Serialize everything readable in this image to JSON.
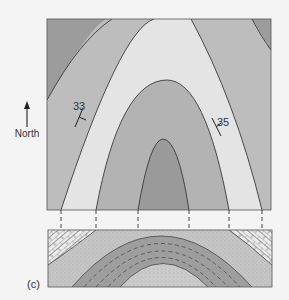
{
  "figure": {
    "panel_label": "(c)",
    "north_label": "North",
    "strike_dip": [
      {
        "value": "33",
        "side": "west"
      },
      {
        "value": "35",
        "side": "east"
      }
    ]
  },
  "map": {
    "description": "Geologic map view of a plunging anticline",
    "colors": {
      "outer_dark": "#9c9c9c",
      "band_mid": "#bdbdbd",
      "band_light": "#e4e4e4",
      "inner_mid": "#b3b3b3",
      "core_dark": "#9a9a9a",
      "line": "#3a3a3a"
    }
  },
  "section": {
    "description": "Cross-section showing folded strata",
    "colors": {
      "limestone": "#e8e8e8",
      "sandstone": "#c6c6c6",
      "shale": "#9e9e9e",
      "core": "#c9c9c9"
    }
  }
}
